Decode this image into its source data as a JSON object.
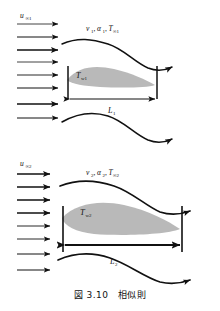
{
  "figure": {
    "caption": "図 3.10　相似則",
    "caption_number": "3.10",
    "caption_title": "相似則"
  },
  "colors": {
    "ink": "#111111",
    "boundary_layer_fill": "#b9b9b9",
    "background": "#ffffff"
  },
  "cases": [
    {
      "id": "case-1",
      "freestream_label": "u",
      "freestream_sub": "∞1",
      "properties_label": "ν₁, α₁, T∞₁",
      "property_nu": "ν₁",
      "property_alpha": "α₁",
      "property_tinf": "T∞₁",
      "wall_temp_label": "T",
      "wall_temp_sub": "w1",
      "length_label": "L",
      "length_sub": "1",
      "arrow_count": 8
    },
    {
      "id": "case-2",
      "freestream_label": "u",
      "freestream_sub": "∞2",
      "properties_label": "ν₂, α₂, T∞₂",
      "property_nu": "ν₂",
      "property_alpha": "α₂",
      "property_tinf": "T∞₂",
      "wall_temp_label": "T",
      "wall_temp_sub": "w2",
      "length_label": "L",
      "length_sub": "2",
      "arrow_count": 8
    }
  ]
}
